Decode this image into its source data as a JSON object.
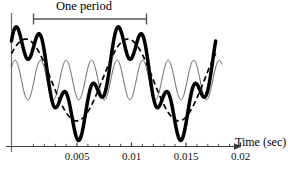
{
  "figure": {
    "annotation": {
      "period_label": "One period",
      "bracket_x_start_px": 33,
      "bracket_x_end_px": 147,
      "bracket_y_px": 19
    },
    "axis": {
      "title": "Time (sec)",
      "tick_labels": [
        "0.005",
        "0.01",
        "0.015",
        "0.02"
      ],
      "tick_values": [
        0.005,
        0.01,
        0.015,
        0.02
      ],
      "minor_ticks_per_interval": 4,
      "arrow_head": true,
      "axis_color": "#3a3a3a",
      "vertical_axis_color": "#6b6b6b"
    },
    "curves": {
      "composite_name": "composite-waveform",
      "envelope_name": "low-frequency-component",
      "carrier_name": "high-frequency-component"
    }
  },
  "chart_data": {
    "type": "line",
    "title": "",
    "xlabel": "Time (sec)",
    "ylabel": "",
    "xlim": [
      0,
      0.0215
    ],
    "ylim": [
      -1.0,
      1.0
    ],
    "grid": false,
    "legend": "none",
    "xticks": [
      0.005,
      0.01,
      0.015,
      0.02
    ],
    "xticklabels": [
      "0.005",
      "0.01",
      "0.015",
      "0.02"
    ],
    "annotations": [
      {
        "text": "One period",
        "type": "span-bracket",
        "x_start": 0.0022,
        "x_end": 0.0122
      }
    ],
    "series": [
      {
        "name": "low-frequency-component",
        "style": "dashed",
        "linewidth": 1.6,
        "color": "#000000",
        "amplitude": 0.62,
        "frequency_hz": 100,
        "phase_deg": 40
      },
      {
        "name": "high-frequency-component",
        "style": "thin-solid",
        "linewidth": 0.8,
        "color": "#444444",
        "amplitude": 0.3,
        "frequency_hz": 400,
        "phase_deg": 40,
        "offset": 0.0
      },
      {
        "name": "composite-waveform",
        "style": "thick-solid",
        "linewidth": 3.4,
        "color": "#000000",
        "description": "sum of low-frequency and high-frequency components"
      }
    ]
  }
}
